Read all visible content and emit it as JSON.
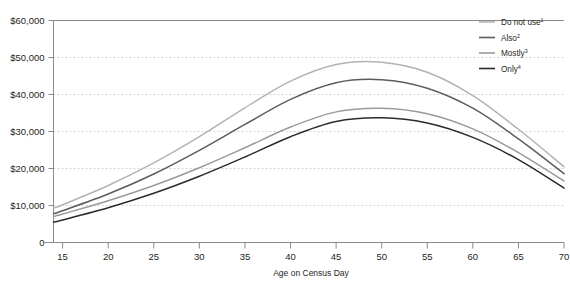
{
  "chart_data": {
    "type": "line",
    "title": "",
    "subtitle": "",
    "xlabel": "Age on Census Day",
    "ylabel": "",
    "xlim": [
      14,
      70
    ],
    "ylim": [
      0,
      60000
    ],
    "grid": true,
    "legend_position": "top-right",
    "x_ticks": [
      15,
      20,
      25,
      30,
      35,
      40,
      45,
      50,
      55,
      60,
      65,
      70
    ],
    "x_tick_labels": [
      "15",
      "20",
      "25",
      "30",
      "35",
      "40",
      "45",
      "50",
      "55",
      "60",
      "65",
      "70"
    ],
    "y_ticks": [
      0,
      10000,
      20000,
      30000,
      40000,
      50000,
      60000
    ],
    "y_tick_labels": [
      "0",
      "$10,000",
      "$20,000",
      "$30,000",
      "$40,000",
      "$50,000",
      "$60,000"
    ],
    "x": [
      14,
      15,
      20,
      25,
      30,
      35,
      40,
      45,
      50,
      55,
      60,
      65,
      70
    ],
    "series": [
      {
        "name": "Do not use",
        "footnote": "1",
        "color": "#b3b3b3",
        "width": 1.5,
        "values": [
          9300,
          10200,
          15400,
          21500,
          28600,
          36400,
          43600,
          48100,
          48700,
          46000,
          39700,
          30600,
          20500
        ]
      },
      {
        "name": "Also",
        "footnote": "2",
        "color": "#5c5c5c",
        "width": 1.5,
        "values": [
          7800,
          8600,
          13100,
          18500,
          24900,
          31900,
          38700,
          43200,
          44000,
          41700,
          36300,
          28000,
          18600
        ]
      },
      {
        "name": "Mostly",
        "footnote": "3",
        "color": "#9a9a9a",
        "width": 1.5,
        "values": [
          7000,
          7700,
          11300,
          15400,
          20200,
          25600,
          31200,
          35300,
          36300,
          34800,
          30700,
          24300,
          16600
        ]
      },
      {
        "name": "Only",
        "footnote": "4",
        "color": "#2b2b2b",
        "width": 1.5,
        "values": [
          5500,
          6100,
          9400,
          13300,
          17900,
          23100,
          28600,
          32700,
          33700,
          32300,
          28400,
          22400,
          14700
        ]
      }
    ],
    "legend_entries": [
      {
        "label": "Do not use",
        "footnote": "1",
        "color": "#b3b3b3"
      },
      {
        "label": "Also",
        "footnote": "2",
        "color": "#5c5c5c"
      },
      {
        "label": "Mostly",
        "footnote": "3",
        "color": "#9a9a9a"
      },
      {
        "label": "Only",
        "footnote": "4",
        "color": "#2b2b2b"
      }
    ],
    "colors": {
      "grid": "#c9c9c9",
      "axis": "#8a8a8a",
      "text": "#231f20",
      "background": "#ffffff"
    }
  }
}
